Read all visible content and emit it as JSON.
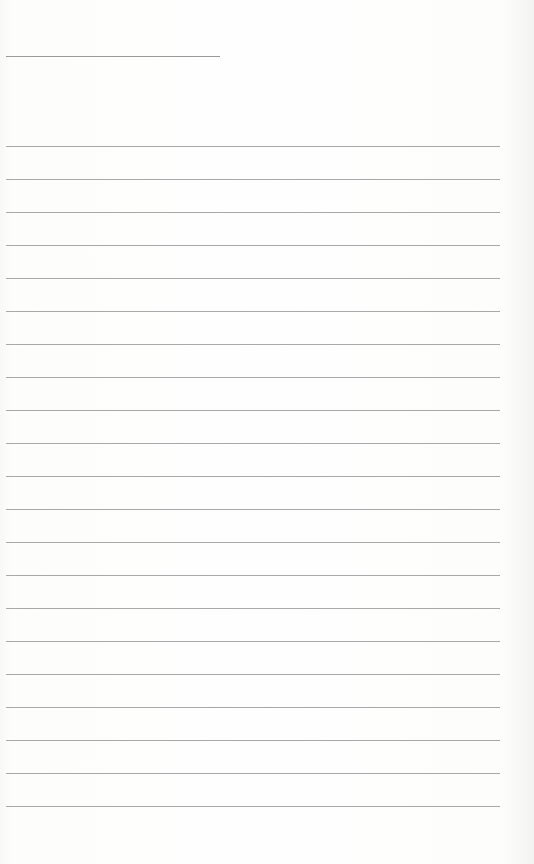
{
  "page": {
    "type": "blank lined paper",
    "header_line": {
      "x": 6,
      "y": 56,
      "width": 214
    },
    "rule_lines": {
      "count": 21,
      "start_y": 146,
      "spacing": 33,
      "x": 6,
      "width": 494
    },
    "colors": {
      "paper": "#fefefe",
      "line": "#a8a8a8",
      "header_line": "#9a9a9a"
    }
  }
}
